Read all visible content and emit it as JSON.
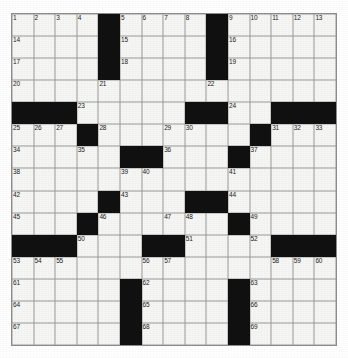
{
  "puzzle": {
    "type": "crossword-grid",
    "rows": 15,
    "cols": 15,
    "colors": {
      "block": "#111111",
      "cell": "#f6f6f4",
      "gridline": "#8d8d8d",
      "number": "#1a1a1a",
      "page": "#ffffff"
    },
    "blocks": [
      [
        0,
        4
      ],
      [
        0,
        9
      ],
      [
        1,
        4
      ],
      [
        1,
        9
      ],
      [
        2,
        4
      ],
      [
        2,
        9
      ],
      [
        4,
        0
      ],
      [
        4,
        1
      ],
      [
        4,
        2
      ],
      [
        4,
        8
      ],
      [
        4,
        9
      ],
      [
        4,
        12
      ],
      [
        4,
        13
      ],
      [
        4,
        14
      ],
      [
        5,
        3
      ],
      [
        5,
        11
      ],
      [
        6,
        5
      ],
      [
        6,
        6
      ],
      [
        6,
        10
      ],
      [
        8,
        4
      ],
      [
        8,
        8
      ],
      [
        8,
        9
      ],
      [
        9,
        3
      ],
      [
        9,
        10
      ],
      [
        10,
        0
      ],
      [
        10,
        1
      ],
      [
        10,
        2
      ],
      [
        10,
        6
      ],
      [
        10,
        7
      ],
      [
        10,
        12
      ],
      [
        10,
        13
      ],
      [
        10,
        14
      ],
      [
        12,
        5
      ],
      [
        12,
        10
      ],
      [
        13,
        5
      ],
      [
        13,
        10
      ],
      [
        14,
        5
      ],
      [
        14,
        10
      ]
    ],
    "numbers": [
      {
        "row": 0,
        "col": 0,
        "n": "1"
      },
      {
        "row": 0,
        "col": 1,
        "n": "2"
      },
      {
        "row": 0,
        "col": 2,
        "n": "3"
      },
      {
        "row": 0,
        "col": 3,
        "n": "4"
      },
      {
        "row": 0,
        "col": 5,
        "n": "5"
      },
      {
        "row": 0,
        "col": 6,
        "n": "6"
      },
      {
        "row": 0,
        "col": 7,
        "n": "7"
      },
      {
        "row": 0,
        "col": 8,
        "n": "8"
      },
      {
        "row": 0,
        "col": 10,
        "n": "9"
      },
      {
        "row": 0,
        "col": 11,
        "n": "10"
      },
      {
        "row": 0,
        "col": 12,
        "n": "11"
      },
      {
        "row": 0,
        "col": 13,
        "n": "12"
      },
      {
        "row": 0,
        "col": 14,
        "n": "13"
      },
      {
        "row": 1,
        "col": 0,
        "n": "14"
      },
      {
        "row": 1,
        "col": 5,
        "n": "15"
      },
      {
        "row": 1,
        "col": 10,
        "n": "16"
      },
      {
        "row": 2,
        "col": 0,
        "n": "17"
      },
      {
        "row": 2,
        "col": 5,
        "n": "18"
      },
      {
        "row": 2,
        "col": 10,
        "n": "19"
      },
      {
        "row": 3,
        "col": 0,
        "n": "20"
      },
      {
        "row": 3,
        "col": 4,
        "n": "21"
      },
      {
        "row": 3,
        "col": 9,
        "n": "22"
      },
      {
        "row": 4,
        "col": 3,
        "n": "23"
      },
      {
        "row": 4,
        "col": 10,
        "n": "24"
      },
      {
        "row": 5,
        "col": 0,
        "n": "25"
      },
      {
        "row": 5,
        "col": 1,
        "n": "26"
      },
      {
        "row": 5,
        "col": 2,
        "n": "27"
      },
      {
        "row": 5,
        "col": 4,
        "n": "28"
      },
      {
        "row": 5,
        "col": 7,
        "n": "29"
      },
      {
        "row": 5,
        "col": 8,
        "n": "30"
      },
      {
        "row": 5,
        "col": 12,
        "n": "31"
      },
      {
        "row": 5,
        "col": 13,
        "n": "32"
      },
      {
        "row": 5,
        "col": 14,
        "n": "33"
      },
      {
        "row": 6,
        "col": 0,
        "n": "34"
      },
      {
        "row": 6,
        "col": 3,
        "n": "35"
      },
      {
        "row": 6,
        "col": 7,
        "n": "36"
      },
      {
        "row": 6,
        "col": 11,
        "n": "37"
      },
      {
        "row": 7,
        "col": 0,
        "n": "38"
      },
      {
        "row": 7,
        "col": 5,
        "n": "39"
      },
      {
        "row": 7,
        "col": 6,
        "n": "40"
      },
      {
        "row": 7,
        "col": 10,
        "n": "41"
      },
      {
        "row": 8,
        "col": 0,
        "n": "42"
      },
      {
        "row": 8,
        "col": 5,
        "n": "43"
      },
      {
        "row": 8,
        "col": 10,
        "n": "44"
      },
      {
        "row": 9,
        "col": 0,
        "n": "45"
      },
      {
        "row": 9,
        "col": 4,
        "n": "46"
      },
      {
        "row": 9,
        "col": 7,
        "n": "47"
      },
      {
        "row": 9,
        "col": 8,
        "n": "48"
      },
      {
        "row": 9,
        "col": 11,
        "n": "49"
      },
      {
        "row": 10,
        "col": 3,
        "n": "50"
      },
      {
        "row": 10,
        "col": 8,
        "n": "51"
      },
      {
        "row": 10,
        "col": 11,
        "n": "52"
      },
      {
        "row": 11,
        "col": 0,
        "n": "53"
      },
      {
        "row": 11,
        "col": 1,
        "n": "54"
      },
      {
        "row": 11,
        "col": 2,
        "n": "55"
      },
      {
        "row": 11,
        "col": 6,
        "n": "56"
      },
      {
        "row": 11,
        "col": 7,
        "n": "57"
      },
      {
        "row": 11,
        "col": 12,
        "n": "58"
      },
      {
        "row": 11,
        "col": 13,
        "n": "59"
      },
      {
        "row": 11,
        "col": 14,
        "n": "60"
      },
      {
        "row": 12,
        "col": 0,
        "n": "61"
      },
      {
        "row": 12,
        "col": 6,
        "n": "62"
      },
      {
        "row": 12,
        "col": 11,
        "n": "63"
      },
      {
        "row": 13,
        "col": 0,
        "n": "64"
      },
      {
        "row": 13,
        "col": 6,
        "n": "65"
      },
      {
        "row": 13,
        "col": 11,
        "n": "66"
      },
      {
        "row": 14,
        "col": 0,
        "n": "67"
      },
      {
        "row": 14,
        "col": 6,
        "n": "68"
      },
      {
        "row": 14,
        "col": 11,
        "n": "69"
      }
    ]
  }
}
